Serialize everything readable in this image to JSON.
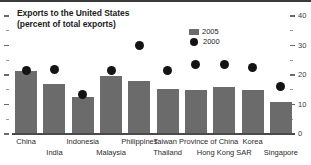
{
  "figure": {
    "title_line1": "Exports to the United States",
    "title_line2": "(percent of total exports)"
  },
  "legend": {
    "items": [
      {
        "label": "2005",
        "marker": "bar-swatch",
        "color": "#6b6b6b"
      },
      {
        "label": "2000",
        "marker": "dot",
        "color": "#141414"
      }
    ]
  },
  "axis": {
    "tick_labels": [
      "0",
      "10",
      "20",
      "30",
      "40"
    ],
    "minor_ticks": [
      5,
      15,
      25,
      35
    ]
  },
  "chart_data": {
    "type": "bar",
    "title": "Exports to the United States (percent of total exports)",
    "xlabel": "",
    "ylabel": "",
    "ylim": [
      0,
      40
    ],
    "yticks": [
      0,
      10,
      20,
      30,
      40
    ],
    "grid": false,
    "legend_position": "top-right",
    "categories": [
      "China",
      "India",
      "Indonesia",
      "Malaysia",
      "Philippines",
      "Thailand",
      "Taiwan Province of China",
      "Hong Kong SAR",
      "Korea",
      "Singapore"
    ],
    "series": [
      {
        "name": "2005",
        "type": "bar",
        "color": "#6b6b6b",
        "values": [
          21.5,
          17.0,
          12.5,
          19.5,
          18.0,
          15.3,
          15.0,
          16.0,
          14.8,
          10.8
        ]
      },
      {
        "name": "2000",
        "type": "scatter",
        "color": "#141414",
        "values": [
          21.5,
          22.0,
          13.5,
          21.5,
          30.0,
          21.5,
          23.5,
          23.5,
          22.5,
          16.0
        ]
      }
    ]
  },
  "label_rows": {
    "top": [
      "China",
      "Indonesia",
      "Philippines",
      "Taiwan Province of China",
      "Korea"
    ],
    "bottom": [
      "India",
      "Malaysia",
      "Thailand",
      "Hong Kong SAR",
      "Singapore"
    ]
  }
}
